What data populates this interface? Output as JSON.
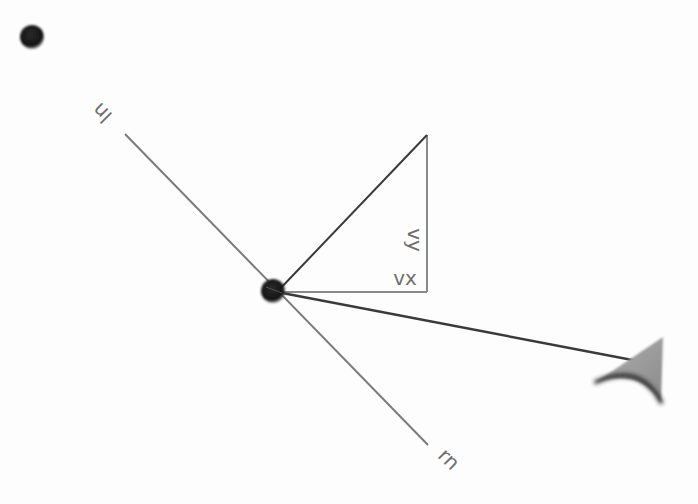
{
  "diagram": {
    "title": "",
    "colors": {
      "background": "#fdfdfd",
      "ball": "#1a1a1a",
      "normal_line": "#7a7a7a",
      "component_line": "#8a8a8a",
      "velocity_line": "#3a3a3a",
      "arrowhead_fill": "#9a9a9a",
      "arrowhead_shadow": "#2a2a2a",
      "label": "#6e6e6e"
    },
    "labels": {
      "left_normal": "ln",
      "right_normal": "rn",
      "vx": "vx",
      "vy": "vy"
    },
    "balls": [
      {
        "name": "small-ball",
        "cx": 32,
        "cy": 37,
        "r": 12
      },
      {
        "name": "center-ball",
        "cx": 273,
        "cy": 291,
        "r": 12
      }
    ],
    "normal_line": {
      "x1": 125,
      "y1": 134,
      "x2": 428,
      "y2": 445
    },
    "triangle": {
      "origin": [
        277,
        292
      ],
      "corner": [
        427,
        292
      ],
      "apex": [
        427,
        135
      ]
    },
    "velocity": {
      "x1": 277,
      "y1": 292,
      "x2": 648,
      "y2": 363
    }
  }
}
